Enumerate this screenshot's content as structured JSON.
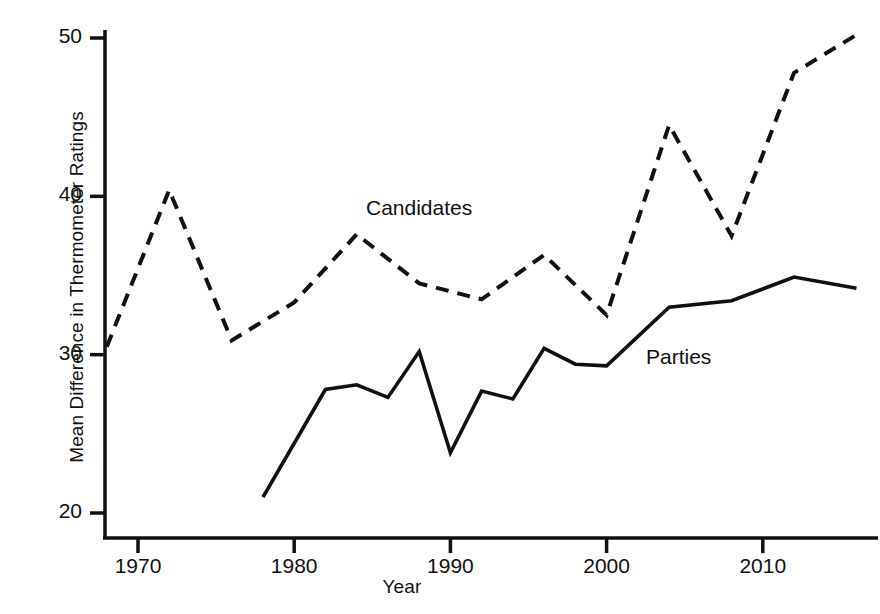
{
  "chart_data": {
    "type": "line",
    "title": "",
    "xlabel": "Year",
    "ylabel": "Mean Difference in Thermometer Ratings",
    "xlim": [
      1966,
      2018
    ],
    "ylim": [
      18.5,
      51.5
    ],
    "xticks": [
      1970,
      1980,
      1990,
      2000,
      2010
    ],
    "xtick_labels": [
      "1970",
      "1980",
      "1990",
      "2000",
      "2010"
    ],
    "yticks": [
      20,
      30,
      40,
      50
    ],
    "ytick_labels": [
      "20",
      "30",
      "40",
      "50"
    ],
    "grid": false,
    "legend_position": "inline-annotations",
    "series": [
      {
        "name": "Candidates",
        "style": "dashed",
        "color": "#111111",
        "x": [
          1968,
          1972,
          1976,
          1980,
          1984,
          1988,
          1992,
          1996,
          2000,
          2004,
          2008,
          2012,
          2016
        ],
        "values": [
          30.5,
          40.4,
          30.9,
          33.3,
          37.6,
          34.5,
          33.5,
          36.3,
          32.5,
          44.5,
          37.5,
          47.8,
          50.2
        ]
      },
      {
        "name": "Parties",
        "style": "solid",
        "color": "#111111",
        "x": [
          1978,
          1982,
          1984,
          1986,
          1988,
          1990,
          1992,
          1994,
          1996,
          1998,
          2000,
          2004,
          2008,
          2012,
          2016
        ],
        "values": [
          21.0,
          27.8,
          28.1,
          27.3,
          30.2,
          23.8,
          27.7,
          27.2,
          30.4,
          29.4,
          29.3,
          33.0,
          33.4,
          34.9,
          34.2
        ]
      }
    ],
    "annotations": [
      {
        "name": "candidates-label",
        "text": "Candidates",
        "x": 1984.5,
        "y": 39.2
      },
      {
        "name": "parties-label",
        "text": "Parties",
        "x": 2002.5,
        "y": 30.0
      }
    ]
  },
  "axes": {
    "y_title": "Mean Difference in Thermometer Ratings",
    "x_title": "Year"
  }
}
